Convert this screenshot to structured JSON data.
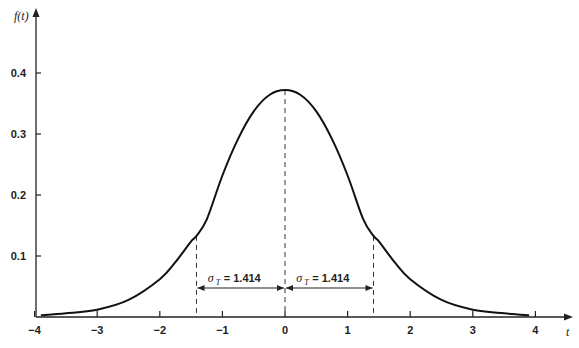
{
  "chart_data": {
    "type": "line",
    "title": "",
    "xlabel": "t",
    "ylabel": "f(t)",
    "xlim": [
      -4,
      4
    ],
    "ylim": [
      0,
      0.4
    ],
    "grid": false,
    "legend": null,
    "x_ticks": [
      "−4",
      "−3",
      "−2",
      "−1",
      "0",
      "1",
      "2",
      "3",
      "4"
    ],
    "x_tick_values": [
      -4,
      -3,
      -2,
      -1,
      0,
      1,
      2,
      3,
      4
    ],
    "y_ticks": [
      "0.1",
      "0.2",
      "0.3",
      "0.4"
    ],
    "y_tick_values": [
      0.1,
      0.2,
      0.3,
      0.4
    ],
    "series": [
      {
        "name": "f(t)",
        "x": [
          -3.9,
          -3.5,
          -3,
          -2.5,
          -2,
          -1.75,
          -1.5,
          -1.414,
          -1.25,
          -1,
          -0.75,
          -0.5,
          -0.25,
          0,
          0.25,
          0.5,
          0.75,
          1,
          1.25,
          1.414,
          1.5,
          1.75,
          2,
          2.5,
          3,
          3.5,
          3.9
        ],
        "values": [
          0.003,
          0.006,
          0.012,
          0.028,
          0.062,
          0.09,
          0.124,
          0.133,
          0.16,
          0.232,
          0.292,
          0.337,
          0.364,
          0.372,
          0.364,
          0.337,
          0.292,
          0.232,
          0.16,
          0.133,
          0.124,
          0.09,
          0.062,
          0.028,
          0.012,
          0.006,
          0.003
        ]
      }
    ],
    "annotations": [
      {
        "type": "vline_dashed",
        "x": -1.414
      },
      {
        "type": "vline_dashed",
        "x": 0
      },
      {
        "type": "vline_dashed",
        "x": 1.414
      },
      {
        "type": "double_arrow",
        "from": -1.414,
        "to": 0,
        "y": 0.09,
        "label_symbol": "σ",
        "label_sub": "T",
        "label_value": "= 1.414"
      },
      {
        "type": "double_arrow",
        "from": 0,
        "to": 1.414,
        "y": 0.09,
        "label_symbol": "σ",
        "label_sub": "T",
        "label_value": "= 1.414"
      }
    ]
  },
  "labels": {
    "y_axis": "f(t)",
    "x_axis": "t",
    "left_sigma_value": "= 1.414",
    "right_sigma_value": "= 1.414",
    "sigma": "σ",
    "sigma_sub": "T"
  }
}
